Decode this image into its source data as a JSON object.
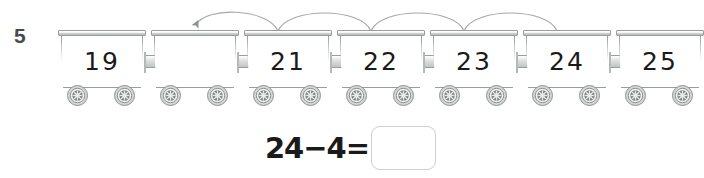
{
  "worksheet": {
    "question_number": "5",
    "instruction_visible": false
  },
  "train": {
    "carts": [
      {
        "label": "19",
        "empty": false
      },
      {
        "label": "",
        "empty": true
      },
      {
        "label": "21",
        "empty": false
      },
      {
        "label": "22",
        "empty": false
      },
      {
        "label": "23",
        "empty": false
      },
      {
        "label": "24",
        "empty": false
      },
      {
        "label": "25",
        "empty": false
      }
    ],
    "cart_count": 7,
    "wheels_per_cart": 2,
    "coupling_count": 6
  },
  "arcs": {
    "count": 4,
    "direction": "right-to-left",
    "arrowhead_on": "leftmost-arc",
    "spans_from_cart_index": 6,
    "spans_to_cart_index": 2
  },
  "equation": {
    "left_operand": "24",
    "operator": "−",
    "right_operand": "4",
    "equals": "=",
    "expression": "24−4=",
    "answer_value": "",
    "answer_placeholder": ""
  },
  "colors": {
    "ink": "#1a1a1a",
    "question_number": "#4a4a4a",
    "cart_outline": "#9a9d9d",
    "roof_fill": "#c2c5c5",
    "wheel_dark": "#6e7272",
    "wheel_light": "#d5d7d7",
    "arc_stroke": "#a5a8a8",
    "answer_box_border": "#cfcfcf",
    "page_background": "#ffffff"
  }
}
